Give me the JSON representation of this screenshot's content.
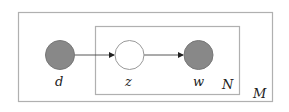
{
  "diagram": {
    "type": "plate-notation",
    "colors": {
      "observed_fill": "#888888",
      "latent_fill": "#ffffff",
      "node_stroke": "#777777",
      "plate_stroke": "#b0b0b0",
      "edge": "#333333"
    },
    "plates": [
      {
        "id": "outer",
        "label": "M"
      },
      {
        "id": "inner",
        "label": "N"
      }
    ],
    "nodes": [
      {
        "id": "d",
        "label": "d",
        "observed": true
      },
      {
        "id": "z",
        "label": "z",
        "observed": false
      },
      {
        "id": "w",
        "label": "w",
        "observed": true
      }
    ],
    "edges": [
      {
        "from": "d",
        "to": "z"
      },
      {
        "from": "z",
        "to": "w"
      }
    ]
  }
}
